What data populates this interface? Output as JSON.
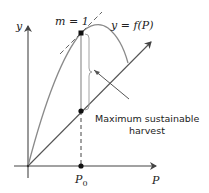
{
  "diagram": {
    "y_axis_label": "y",
    "x_axis_label": "P",
    "curve_label": "y = f(P)",
    "tangent_label": "m = 1",
    "p0_label": "P",
    "p0_subscript": "0",
    "annotation_line1": "Maximum sustainable",
    "annotation_line2": "harvest",
    "colors": {
      "axis": "#444444",
      "curve": "#8a8a8a",
      "diagonal": "#555555",
      "tangent": "#666666",
      "point": "#111111",
      "text": "#222222"
    }
  }
}
